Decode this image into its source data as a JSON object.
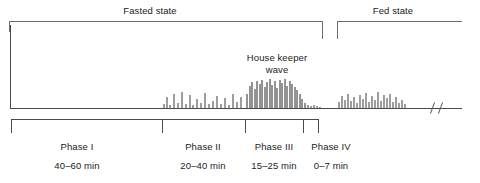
{
  "figure": {
    "axis_break_symbol": "//"
  },
  "states": [
    {
      "id": "fasted",
      "label": "Fasted state",
      "x": 9,
      "width": 314,
      "label_center": 150
    },
    {
      "id": "fed",
      "label": "Fed state",
      "x": 337,
      "width": 125,
      "label_center": 393
    }
  ],
  "annotations": [
    {
      "id": "housekeeper",
      "line1": "House keeper",
      "line2": "wave",
      "center": 277,
      "top": 52
    }
  ],
  "phases": [
    {
      "id": "phase-1",
      "name": "Phase I",
      "duration": "40–60 min",
      "center": 77,
      "start": 11,
      "end": 162
    },
    {
      "id": "phase-2",
      "name": "Phase II",
      "duration": "20–40 min",
      "center": 203,
      "start": 162,
      "end": 245
    },
    {
      "id": "phase-3",
      "name": "Phase III",
      "duration": "15–25 min",
      "center": 274,
      "start": 245,
      "end": 303
    },
    {
      "id": "phase-4",
      "name": "Phase IV",
      "duration": "0–7 min",
      "center": 331,
      "start": 303,
      "end": 319
    }
  ],
  "colors": {
    "spike": "#8d8d8d",
    "axis": "#4a4a4a",
    "bracket": "#6e6e6e",
    "text": "#222222",
    "background": "#ffffff"
  },
  "chart_data": {
    "type": "bar",
    "xlabel": "",
    "ylabel": "",
    "grid": false,
    "legend": null,
    "baseline_y": 108,
    "note": "x = pixel position along time axis, h = spike height in pixels above baseline",
    "series": [
      {
        "name": "Phase II irregular contractions",
        "x": [
          163,
          166,
          169,
          173,
          177,
          181,
          185,
          189,
          192,
          196,
          200,
          204,
          208,
          212,
          216,
          220,
          224,
          228,
          232,
          236,
          240
        ],
        "values": [
          4,
          11,
          3,
          14,
          5,
          16,
          4,
          13,
          3,
          9,
          5,
          15,
          4,
          7,
          12,
          4,
          10,
          3,
          14,
          6,
          11
        ]
      },
      {
        "name": "Phase III house keeper wave",
        "x": [
          246,
          249,
          251,
          254,
          256,
          259,
          261,
          264,
          266,
          269,
          271,
          274,
          276,
          279,
          281,
          284,
          286,
          289,
          291,
          294,
          296,
          299,
          301,
          304
        ],
        "values": [
          14,
          22,
          26,
          19,
          27,
          24,
          28,
          21,
          26,
          29,
          23,
          27,
          20,
          28,
          25,
          29,
          22,
          27,
          24,
          21,
          18,
          14,
          9,
          5
        ]
      },
      {
        "name": "Phase IV / quiescence",
        "x": [
          307,
          310,
          313,
          316,
          319
        ],
        "values": [
          3,
          2,
          3,
          2,
          1
        ]
      },
      {
        "name": "Fed state continuous contractions",
        "x": [
          338,
          341,
          344,
          347,
          350,
          353,
          356,
          359,
          362,
          365,
          368,
          371,
          374,
          377,
          380,
          383,
          386,
          389,
          392,
          395,
          398,
          401,
          404
        ],
        "values": [
          6,
          12,
          8,
          14,
          7,
          11,
          5,
          13,
          9,
          15,
          6,
          12,
          8,
          16,
          7,
          13,
          10,
          14,
          6,
          11,
          5,
          8,
          4
        ]
      }
    ]
  }
}
